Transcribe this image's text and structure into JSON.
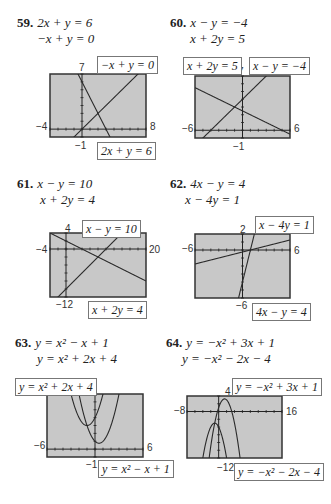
{
  "problems": [
    {
      "num": "59.",
      "eq1": "2x + y = 6",
      "eq2": "−x + y = 0",
      "window": {
        "xmin": "−4",
        "xmax": "8",
        "ymin": "−1",
        "ymax": "7"
      },
      "labels": [
        "−x + y = 0",
        "2x + y = 6"
      ]
    },
    {
      "num": "60.",
      "eq1": "x − y = −4",
      "eq2": "x + 2y = 5",
      "window": {
        "xmin": "−6",
        "xmax": "6",
        "ymin": "−1",
        "ymax": "7"
      },
      "labels": [
        "x + 2y = 5",
        "x − y = −4"
      ]
    },
    {
      "num": "61.",
      "eq1": "x − y = 10",
      "eq2": "x + 2y = 4",
      "window": {
        "xmin": "−4",
        "xmax": "20",
        "ymin": "−12",
        "ymax": "4"
      },
      "labels": [
        "x − y = 10",
        "x + 2y = 4"
      ]
    },
    {
      "num": "62.",
      "eq1": "4x − y = 4",
      "eq2": "x − 4y = 1",
      "window": {
        "xmin": "−6",
        "xmax": "6",
        "ymin": "−6",
        "ymax": "2"
      },
      "labels": [
        "x − 4y = 1",
        "4x − y = 4"
      ]
    },
    {
      "num": "63.",
      "eq1": "y = x² − x + 1",
      "eq2": "y = x² + 2x + 4",
      "window": {
        "xmin": "−6",
        "xmax": "6",
        "ymin": "−1",
        "ymax": "7"
      },
      "labels": [
        "y = x² + 2x + 4",
        "y = x² − x + 1"
      ]
    },
    {
      "num": "64.",
      "eq1": "y = −x² + 3x + 1",
      "eq2": "y = −x² − 2x − 4",
      "window": {
        "xmin": "−8",
        "xmax": "16",
        "ymin": "−12",
        "ymax": "4"
      },
      "labels": [
        "y = −x² + 3x + 1",
        "y = −x² − 2x − 4"
      ]
    }
  ],
  "footer_cut_text": "",
  "colors": {
    "screen": "#c8c8c8",
    "border": "#333333",
    "line": "#2a2a2a"
  },
  "chart_data": [
    {
      "type": "line",
      "title": "59",
      "xlim": [
        -4,
        8
      ],
      "ylim": [
        -1,
        7
      ],
      "series": [
        {
          "name": "2x + y = 6",
          "equation": "y = -2x + 6"
        },
        {
          "name": "−x + y = 0",
          "equation": "y = x"
        }
      ],
      "intersection": [
        2,
        2
      ]
    },
    {
      "type": "line",
      "title": "60",
      "xlim": [
        -6,
        6
      ],
      "ylim": [
        -1,
        7
      ],
      "series": [
        {
          "name": "x − y = −4",
          "equation": "y = x + 4"
        },
        {
          "name": "x + 2y = 5",
          "equation": "y = (5 - x)/2"
        }
      ],
      "intersection": [
        -1,
        3
      ]
    },
    {
      "type": "line",
      "title": "61",
      "xlim": [
        -4,
        20
      ],
      "ylim": [
        -12,
        4
      ],
      "series": [
        {
          "name": "x − y = 10",
          "equation": "y = x - 10"
        },
        {
          "name": "x + 2y = 4",
          "equation": "y = (4 - x)/2"
        }
      ],
      "intersection": [
        8,
        -2
      ]
    },
    {
      "type": "line",
      "title": "62",
      "xlim": [
        -6,
        6
      ],
      "ylim": [
        -6,
        2
      ],
      "series": [
        {
          "name": "4x − y = 4",
          "equation": "y = 4x - 4"
        },
        {
          "name": "x − 4y = 1",
          "equation": "y = (x - 1)/4"
        }
      ],
      "intersection": [
        1,
        0
      ]
    },
    {
      "type": "line",
      "title": "63",
      "xlim": [
        -6,
        6
      ],
      "ylim": [
        -1,
        7
      ],
      "series": [
        {
          "name": "y = x² − x + 1",
          "equation": "y = x^2 - x + 1"
        },
        {
          "name": "y = x² + 2x + 4",
          "equation": "y = x^2 + 2x + 4"
        }
      ],
      "intersection": [
        -1,
        3
      ]
    },
    {
      "type": "line",
      "title": "64",
      "xlim": [
        -8,
        16
      ],
      "ylim": [
        -12,
        4
      ],
      "series": [
        {
          "name": "y = −x² + 3x + 1",
          "equation": "y = -x^2 + 3x + 1"
        },
        {
          "name": "y = −x² − 2x − 4",
          "equation": "y = -x^2 - 2x - 4"
        }
      ],
      "intersection": [
        -1,
        -3
      ]
    }
  ]
}
